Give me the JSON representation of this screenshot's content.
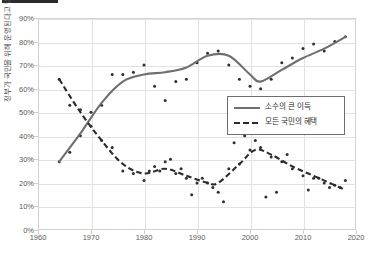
{
  "title": {
    "bar_present": true,
    "ghost_text": ""
  },
  "chart_data": {
    "type": "scatter",
    "title": "",
    "subtitle": "",
    "xlabel": "",
    "ylabel": "정부가 국민을 위해 운영된다고 말하는 비율",
    "xlim": [
      1960,
      2020
    ],
    "ylim": [
      0,
      90
    ],
    "xticks": [
      "1960",
      "1970",
      "1980",
      "1990",
      "2000",
      "2010",
      "2020"
    ],
    "yticks": [
      "0%",
      "10%",
      "20%",
      "30%",
      "40%",
      "50%",
      "60%",
      "70%",
      "80%",
      "90%"
    ],
    "grid": true,
    "legend_position": "center-right",
    "legend": [
      "소수의 큰 이득",
      "모든 국민의 혜택"
    ],
    "series": [
      {
        "name": "소수의 큰 이득",
        "style": "solid",
        "color": "#6f6f6f",
        "points": [
          {
            "x": 1964,
            "y": 29
          },
          {
            "x": 1966,
            "y": 33
          },
          {
            "x": 1968,
            "y": 40
          },
          {
            "x": 1970,
            "y": 50
          },
          {
            "x": 1972,
            "y": 53
          },
          {
            "x": 1974,
            "y": 66
          },
          {
            "x": 1976,
            "y": 66
          },
          {
            "x": 1978,
            "y": 67
          },
          {
            "x": 1980,
            "y": 70
          },
          {
            "x": 1982,
            "y": 61
          },
          {
            "x": 1984,
            "y": 55
          },
          {
            "x": 1986,
            "y": 63
          },
          {
            "x": 1988,
            "y": 64
          },
          {
            "x": 1990,
            "y": 71
          },
          {
            "x": 1992,
            "y": 75
          },
          {
            "x": 1994,
            "y": 76
          },
          {
            "x": 1996,
            "y": 70
          },
          {
            "x": 1998,
            "y": 64
          },
          {
            "x": 2000,
            "y": 61
          },
          {
            "x": 2002,
            "y": 60
          },
          {
            "x": 2004,
            "y": 64
          },
          {
            "x": 2006,
            "y": 71
          },
          {
            "x": 2008,
            "y": 73
          },
          {
            "x": 2010,
            "y": 77
          },
          {
            "x": 2012,
            "y": 79
          },
          {
            "x": 2014,
            "y": 76
          },
          {
            "x": 2016,
            "y": 80
          },
          {
            "x": 2018,
            "y": 82
          }
        ],
        "trend": [
          {
            "x": 1964,
            "y": 29
          },
          {
            "x": 1968,
            "y": 41
          },
          {
            "x": 1972,
            "y": 54
          },
          {
            "x": 1976,
            "y": 63
          },
          {
            "x": 1980,
            "y": 66
          },
          {
            "x": 1984,
            "y": 67
          },
          {
            "x": 1988,
            "y": 69
          },
          {
            "x": 1992,
            "y": 74
          },
          {
            "x": 1996,
            "y": 74
          },
          {
            "x": 2000,
            "y": 66
          },
          {
            "x": 2002,
            "y": 63
          },
          {
            "x": 2006,
            "y": 68
          },
          {
            "x": 2010,
            "y": 73
          },
          {
            "x": 2014,
            "y": 77
          },
          {
            "x": 2018,
            "y": 82
          }
        ]
      },
      {
        "name": "모든 국민의 혜택",
        "style": "dashed",
        "color": "#2b2b2b",
        "points": [
          {
            "x": 1964,
            "y": 64
          },
          {
            "x": 1966,
            "y": 53
          },
          {
            "x": 1968,
            "y": 51
          },
          {
            "x": 1970,
            "y": 44
          },
          {
            "x": 1972,
            "y": 38
          },
          {
            "x": 1974,
            "y": 35
          },
          {
            "x": 1976,
            "y": 25
          },
          {
            "x": 1978,
            "y": 24
          },
          {
            "x": 1980,
            "y": 21
          },
          {
            "x": 1982,
            "y": 27
          },
          {
            "x": 1984,
            "y": 29
          },
          {
            "x": 1986,
            "y": 24
          },
          {
            "x": 1988,
            "y": 22
          },
          {
            "x": 1990,
            "y": 20
          },
          {
            "x": 1992,
            "y": 20
          },
          {
            "x": 1994,
            "y": 16
          },
          {
            "x": 1996,
            "y": 26
          },
          {
            "x": 1998,
            "y": 28
          },
          {
            "x": 2000,
            "y": 34
          },
          {
            "x": 2002,
            "y": 35
          },
          {
            "x": 2004,
            "y": 31
          },
          {
            "x": 2006,
            "y": 29
          },
          {
            "x": 2008,
            "y": 26
          },
          {
            "x": 2010,
            "y": 23
          },
          {
            "x": 2012,
            "y": 22
          },
          {
            "x": 2014,
            "y": 20
          },
          {
            "x": 2016,
            "y": 19
          },
          {
            "x": 2018,
            "y": 21
          }
        ],
        "trend": [
          {
            "x": 1964,
            "y": 64
          },
          {
            "x": 1968,
            "y": 50
          },
          {
            "x": 1972,
            "y": 38
          },
          {
            "x": 1976,
            "y": 28
          },
          {
            "x": 1980,
            "y": 24
          },
          {
            "x": 1984,
            "y": 26
          },
          {
            "x": 1988,
            "y": 23
          },
          {
            "x": 1992,
            "y": 20
          },
          {
            "x": 1994,
            "y": 20
          },
          {
            "x": 1998,
            "y": 28
          },
          {
            "x": 2001,
            "y": 34
          },
          {
            "x": 2004,
            "y": 32
          },
          {
            "x": 2008,
            "y": 27
          },
          {
            "x": 2012,
            "y": 23
          },
          {
            "x": 2016,
            "y": 19
          },
          {
            "x": 2018,
            "y": 17
          }
        ]
      }
    ],
    "extra_scatter": [
      {
        "x": 1995,
        "y": 12
      },
      {
        "x": 1997,
        "y": 37
      },
      {
        "x": 1999,
        "y": 40
      },
      {
        "x": 2001,
        "y": 38
      },
      {
        "x": 2003,
        "y": 14
      },
      {
        "x": 2005,
        "y": 16
      },
      {
        "x": 2007,
        "y": 32
      },
      {
        "x": 2011,
        "y": 17
      },
      {
        "x": 1985,
        "y": 30
      },
      {
        "x": 1987,
        "y": 26
      },
      {
        "x": 1989,
        "y": 15
      },
      {
        "x": 1991,
        "y": 22
      },
      {
        "x": 1993,
        "y": 18
      },
      {
        "x": 1981,
        "y": 25
      },
      {
        "x": 1983,
        "y": 25
      },
      {
        "x": 2013,
        "y": 22
      },
      {
        "x": 2015,
        "y": 18
      },
      {
        "x": 2017,
        "y": 18
      }
    ]
  },
  "colors": {
    "grid": "#e2e2e2",
    "frame": "#d2d2d2",
    "point": "#2f2f2f",
    "solid_series": "#6f6f6f",
    "dashed_series": "#2b2b2b",
    "legend_border": "#6e6e6e",
    "tick_text": "#5a5a5a",
    "axis_title": "#4a4a4a"
  }
}
